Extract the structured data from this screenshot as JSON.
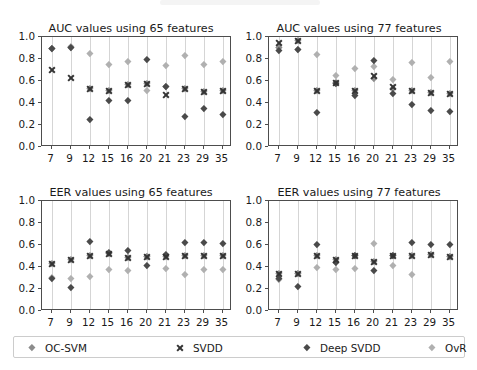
{
  "figure": {
    "width": 477,
    "height": 370,
    "background": "#ffffff"
  },
  "series_styles": {
    "OC-SVM": {
      "marker": "diamond",
      "color": "#8c8c8c"
    },
    "SVDD": {
      "marker": "x",
      "color": "#333333"
    },
    "Deep SVDD": {
      "marker": "diamond",
      "color": "#4a4a4a"
    },
    "OvR": {
      "marker": "diamond",
      "color": "#b0b0b0"
    }
  },
  "legend": {
    "position": "bottom",
    "entries": [
      {
        "label": "OC-SVM",
        "marker": "diamond",
        "color": "#8c8c8c"
      },
      {
        "label": "SVDD",
        "marker": "x",
        "color": "#333333"
      },
      {
        "label": "Deep SVDD",
        "marker": "diamond",
        "color": "#4a4a4a"
      },
      {
        "label": "OvR",
        "marker": "diamond",
        "color": "#b0b0b0"
      }
    ]
  },
  "chart_data": [
    {
      "type": "scatter",
      "panel": "top-left",
      "title": "AUC values using 65 features",
      "xlabel": "",
      "ylabel": "",
      "categories": [
        "7",
        "9",
        "12",
        "15",
        "16",
        "20",
        "21",
        "23",
        "29",
        "35"
      ],
      "yticks": [
        "0.0",
        "0.2",
        "0.4",
        "0.6",
        "0.8",
        "1.0"
      ],
      "ylim": [
        0.0,
        1.0
      ],
      "grid": "vertical",
      "series": [
        {
          "name": "OC-SVM",
          "values": [
            0.89,
            0.9,
            0.53,
            0.51,
            0.56,
            0.57,
            0.55,
            0.53,
            0.5,
            0.51
          ]
        },
        {
          "name": "SVDD",
          "values": [
            0.7,
            0.63,
            0.53,
            0.51,
            0.56,
            0.57,
            0.47,
            0.53,
            0.5,
            0.51
          ]
        },
        {
          "name": "Deep SVDD",
          "values": [
            0.89,
            0.9,
            0.25,
            0.42,
            0.42,
            0.79,
            0.55,
            0.27,
            0.35,
            0.29
          ]
        },
        {
          "name": "OvR",
          "values": [
            0.89,
            0.91,
            0.85,
            0.75,
            0.77,
            0.51,
            0.74,
            0.83,
            0.75,
            0.77
          ]
        }
      ]
    },
    {
      "type": "scatter",
      "panel": "top-right",
      "title": "AUC values using 77 features",
      "xlabel": "",
      "ylabel": "",
      "categories": [
        "7",
        "9",
        "12",
        "15",
        "16",
        "20",
        "21",
        "23",
        "29",
        "35"
      ],
      "yticks": [
        "0.0",
        "0.2",
        "0.4",
        "0.6",
        "0.8",
        "1.0"
      ],
      "ylim": [
        0.0,
        1.0
      ],
      "grid": "vertical",
      "series": [
        {
          "name": "OC-SVM",
          "values": [
            0.9,
            0.96,
            0.51,
            0.58,
            0.51,
            0.62,
            0.53,
            0.51,
            0.49,
            0.48
          ]
        },
        {
          "name": "SVDD",
          "values": [
            0.95,
            0.96,
            0.51,
            0.58,
            0.51,
            0.65,
            0.55,
            0.51,
            0.49,
            0.48
          ]
        },
        {
          "name": "Deep SVDD",
          "values": [
            0.87,
            0.88,
            0.31,
            0.57,
            0.46,
            0.78,
            0.48,
            0.38,
            0.33,
            0.32
          ]
        },
        {
          "name": "OvR",
          "values": [
            0.9,
            0.88,
            0.84,
            0.65,
            0.71,
            0.73,
            0.61,
            0.76,
            0.63,
            0.77
          ]
        }
      ]
    },
    {
      "type": "scatter",
      "panel": "bottom-left",
      "title": "EER values using 65 features",
      "xlabel": "",
      "ylabel": "",
      "categories": [
        "7",
        "9",
        "12",
        "15",
        "16",
        "20",
        "21",
        "23",
        "29",
        "35"
      ],
      "yticks": [
        "0.0",
        "0.2",
        "0.4",
        "0.6",
        "0.8",
        "1.0"
      ],
      "ylim": [
        0.0,
        1.0
      ],
      "grid": "vertical",
      "series": [
        {
          "name": "OC-SVM",
          "values": [
            0.43,
            0.46,
            0.5,
            0.52,
            0.48,
            0.49,
            0.49,
            0.5,
            0.5,
            0.5
          ]
        },
        {
          "name": "SVDD",
          "values": [
            0.43,
            0.46,
            0.5,
            0.52,
            0.48,
            0.49,
            0.49,
            0.5,
            0.5,
            0.5
          ]
        },
        {
          "name": "Deep SVDD",
          "values": [
            0.29,
            0.21,
            0.63,
            0.53,
            0.55,
            0.41,
            0.51,
            0.62,
            0.62,
            0.61
          ]
        },
        {
          "name": "OvR",
          "values": [
            0.3,
            0.29,
            0.31,
            0.37,
            0.36,
            0.49,
            0.38,
            0.33,
            0.37,
            0.37
          ]
        }
      ]
    },
    {
      "type": "scatter",
      "panel": "bottom-right",
      "title": "EER values using 77 features",
      "xlabel": "",
      "ylabel": "",
      "categories": [
        "7",
        "9",
        "12",
        "15",
        "16",
        "20",
        "21",
        "23",
        "29",
        "35"
      ],
      "yticks": [
        "0.0",
        "0.2",
        "0.4",
        "0.6",
        "0.8",
        "1.0"
      ],
      "ylim": [
        0.0,
        1.0
      ],
      "grid": "vertical",
      "series": [
        {
          "name": "OC-SVM",
          "values": [
            0.34,
            0.34,
            0.5,
            0.46,
            0.5,
            0.45,
            0.5,
            0.5,
            0.51,
            0.49
          ]
        },
        {
          "name": "SVDD",
          "values": [
            0.34,
            0.34,
            0.5,
            0.46,
            0.5,
            0.45,
            0.5,
            0.5,
            0.51,
            0.49
          ]
        },
        {
          "name": "Deep SVDD",
          "values": [
            0.29,
            0.22,
            0.6,
            0.44,
            0.5,
            0.36,
            0.5,
            0.62,
            0.6,
            0.6
          ]
        },
        {
          "name": "OvR",
          "values": [
            0.28,
            0.34,
            0.39,
            0.37,
            0.38,
            0.61,
            0.41,
            0.33,
            0.51,
            0.49
          ]
        }
      ]
    }
  ]
}
